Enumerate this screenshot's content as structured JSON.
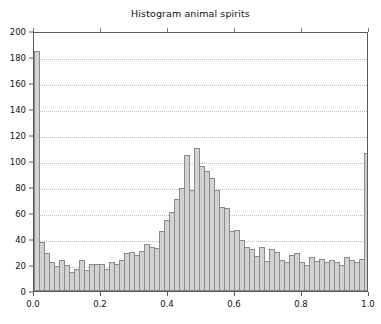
{
  "chart_data": {
    "type": "bar",
    "title": "Histogram animal spirits",
    "subtitle": "",
    "xlabel": "",
    "ylabel": "",
    "xlim": [
      0.0,
      1.0
    ],
    "ylim": [
      0,
      200
    ],
    "grid": true,
    "legend": null,
    "bin_width": 0.0149,
    "n_bins": 67,
    "xticks": [
      0.0,
      0.2,
      0.4,
      0.6,
      0.8,
      1.0
    ],
    "xtick_labels": [
      "0.0",
      "0.2",
      "0.4",
      "0.6",
      "0.8",
      "1.0"
    ],
    "yticks": [
      0,
      20,
      40,
      60,
      80,
      100,
      120,
      140,
      160,
      180,
      200
    ],
    "ytick_labels": [
      "0",
      "20",
      "40",
      "60",
      "80",
      "100",
      "120",
      "140",
      "160",
      "180",
      "200"
    ],
    "bar_fill": "#d2d2d2",
    "bar_edge": "#8a8a8a",
    "grid_color": "#9aa6bb",
    "axis_color": "#5a5a5a",
    "bin_centers": [
      0.007,
      0.022,
      0.037,
      0.052,
      0.067,
      0.082,
      0.097,
      0.112,
      0.127,
      0.142,
      0.157,
      0.172,
      0.187,
      0.201,
      0.216,
      0.231,
      0.246,
      0.261,
      0.276,
      0.291,
      0.306,
      0.321,
      0.336,
      0.351,
      0.366,
      0.381,
      0.396,
      0.411,
      0.425,
      0.44,
      0.455,
      0.47,
      0.485,
      0.5,
      0.515,
      0.53,
      0.545,
      0.56,
      0.575,
      0.59,
      0.605,
      0.62,
      0.635,
      0.649,
      0.664,
      0.679,
      0.694,
      0.709,
      0.724,
      0.739,
      0.754,
      0.769,
      0.784,
      0.799,
      0.814,
      0.829,
      0.844,
      0.858,
      0.873,
      0.888,
      0.903,
      0.918,
      0.933,
      0.948,
      0.963,
      0.978,
      0.993
    ],
    "values": [
      185,
      38,
      29,
      22,
      19,
      24,
      20,
      15,
      17,
      24,
      16,
      21,
      21,
      21,
      17,
      22,
      21,
      24,
      29,
      30,
      28,
      31,
      36,
      34,
      33,
      46,
      55,
      61,
      71,
      79,
      105,
      78,
      110,
      96,
      92,
      87,
      78,
      65,
      64,
      46,
      47,
      39,
      34,
      32,
      27,
      34,
      23,
      32,
      30,
      24,
      22,
      28,
      29,
      22,
      20,
      26,
      23,
      25,
      22,
      24,
      22,
      20,
      26,
      24,
      22,
      25,
      106
    ]
  }
}
